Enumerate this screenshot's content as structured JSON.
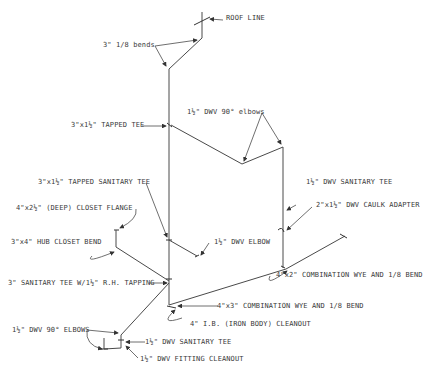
{
  "diagram": {
    "type": "plumbing-riser-isometric",
    "colors": {
      "line": "#4a4a4a",
      "text": "#3a3a3a",
      "background": "#ffffff"
    },
    "labels": {
      "roof_line": "ROOF LINE",
      "bends_1_8": "3\" 1/8 bends",
      "tapped_tee": "3\"x1½\" TAPPED TEE",
      "dwv_90_elbows_upper": "1½\" DWV 90° elbows",
      "dwv_sanitary_tee_right": "1½\" DWV SANITARY TEE",
      "tapped_sanitary_tee": "3\"x1½\" TAPPED SANITARY TEE",
      "caulk_adapter": "2\"x1½\" DWV CAULK ADAPTER",
      "closet_flange": "4\"x2½\" (DEEP) CLOSET FLANGE",
      "dwv_elbow": "1½\" DWV ELBOW",
      "hub_closet_bend": "3\"x4\" HUB CLOSET BEND",
      "combo_wye_4x2": "4\"x2\" COMBINATION WYE AND 1/8 BEND",
      "sanitary_tee_rh_tapping": "3\" SANITARY TEE W/1½\" R.H. TAPPING",
      "combo_wye_4x3": "4\"x3\" COMBINATION WYE AND 1/8 BEND",
      "ib_cleanout": "4\" I.B. (IRON BODY) CLEANOUT",
      "dwv_90_elbows_lower": "1½\" DWV 90° ELBOWS",
      "dwv_sanitary_tee_lower": "1½\" DWV SANITARY TEE",
      "dwv_fitting_cleanout": "1½\" DWV FITTING CLEANOUT"
    }
  }
}
